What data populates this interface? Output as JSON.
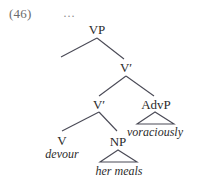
{
  "figure": {
    "example_number": "(46)",
    "ellipsis": "…",
    "type": "syntax-tree",
    "background_color": "#ffffff",
    "line_color": "#4a4a56",
    "text_color": "#2b2b2b",
    "number_color": "#6b6b6b"
  },
  "nodes": {
    "vp": "VP",
    "v_bar_upper": "V′",
    "v_bar_lower": "V′",
    "advp": "AdvP",
    "v": "V",
    "np": "NP"
  },
  "leaves": {
    "devour": "devour",
    "her_meals": "her meals",
    "voraciously": "voraciously"
  }
}
